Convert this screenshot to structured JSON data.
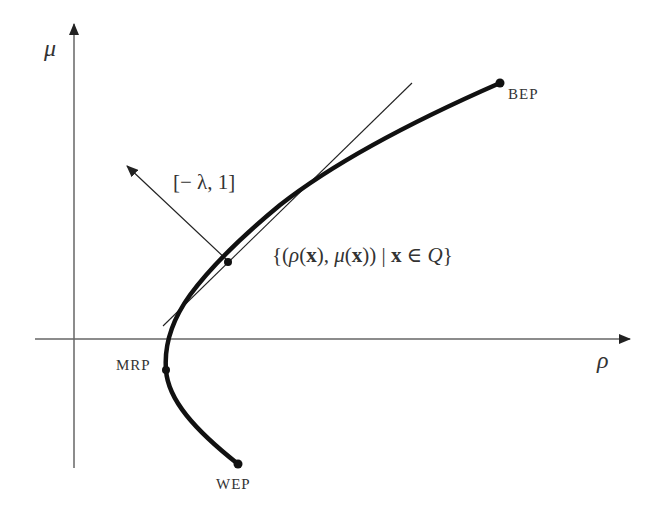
{
  "diagram": {
    "type": "efficient-frontier-scalarization",
    "axes": {
      "x_label": "ρ",
      "y_label": "μ"
    },
    "points": [
      {
        "id": "BEP",
        "label": "BEP"
      },
      {
        "id": "MRP",
        "label": "MRP"
      },
      {
        "id": "WEP",
        "label": "WEP"
      }
    ],
    "normal_vector_label": "[− λ, 1]",
    "curve_label_parts": {
      "open": "{(",
      "rho": "ρ",
      "paren1": "(",
      "x1": "x",
      "close1": "),",
      "mu": " μ",
      "paren2": "(",
      "x2": "x",
      "close2": "))",
      "bar": " | ",
      "x3": "x",
      "in": " ∈ ",
      "Q": "Q",
      "end": "}"
    },
    "colors": {
      "axis": "#555555",
      "curve": "#111111",
      "tangent": "#222222",
      "text": "#333333"
    }
  }
}
